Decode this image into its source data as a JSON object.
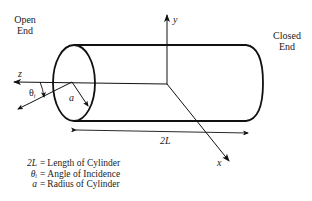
{
  "diagram": {
    "labels": {
      "open_end": [
        "Open",
        "End"
      ],
      "closed_end": [
        "Closed",
        "End"
      ],
      "axis_x": "x",
      "axis_y": "y",
      "axis_z": "z",
      "theta": "θ",
      "theta_sub": "i",
      "radius": "a",
      "length": "2L"
    },
    "legend": [
      {
        "symbol": "2L",
        "definition": "Length of Cylinder"
      },
      {
        "symbol": "θᵢ",
        "definition": "Angle of Incidence"
      },
      {
        "symbol": "a",
        "definition": "Radius of Cylinder"
      }
    ],
    "colors": {
      "stroke": "#111111",
      "text": "#222222",
      "background": "#ffffff"
    }
  }
}
